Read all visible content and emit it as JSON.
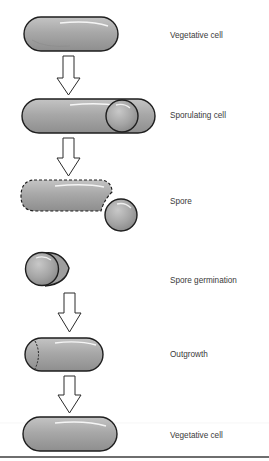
{
  "colors": {
    "cell_fill": "#a9a9a9",
    "cell_outline": "#1e1e1e",
    "arrow_fill": "#ffffff",
    "arrow_stroke": "#2a2a2a",
    "label_text": "#3a3a3a",
    "rule": "#6e6e6e"
  },
  "stages": [
    {
      "id": "vegetative-cell-1",
      "label": "Vegetative cell",
      "label_y": 31
    },
    {
      "id": "sporulating-cell",
      "label": "Sporulating cell",
      "label_y": 111
    },
    {
      "id": "spore",
      "label": "Spore",
      "label_y": 197
    },
    {
      "id": "spore-germination",
      "label": "Spore germination",
      "label_y": 276
    },
    {
      "id": "outgrowth",
      "label": "Outgrowth",
      "label_y": 350
    },
    {
      "id": "vegetative-cell-2",
      "label": "Vegetative cell",
      "label_y": 431
    }
  ],
  "arrows": [
    {
      "from": "vegetative-cell-1",
      "to": "sporulating-cell"
    },
    {
      "from": "sporulating-cell",
      "to": "spore"
    },
    {
      "from": "spore-germination",
      "to": "outgrowth"
    },
    {
      "from": "outgrowth",
      "to": "vegetative-cell-2"
    }
  ]
}
